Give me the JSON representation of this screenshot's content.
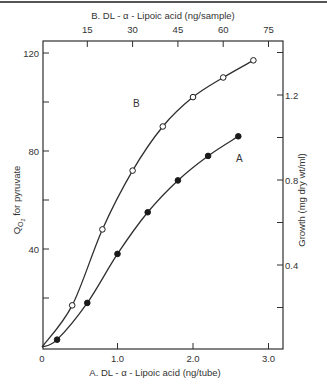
{
  "chart_data": {
    "type": "line",
    "title": "",
    "xlabel": "A. DL-α-Lipoic acid (ng/tube)",
    "x2label": "B. DL-α-Lipoic acid (ng/sample)",
    "ylabel": "Q O2 for pyruvate",
    "y2label": "Growth (mg dry wt/ml)",
    "xlim": [
      0,
      3.2
    ],
    "ylim": [
      0,
      126
    ],
    "x_ticks": [
      "0",
      "1.0",
      "2.0",
      "3.0"
    ],
    "x2_ticks": [
      "15",
      "30",
      "45",
      "60",
      "75"
    ],
    "y_ticks": [
      "40",
      "80",
      "120"
    ],
    "y2_ticks": [
      "0.4",
      "0.8",
      "1.2"
    ],
    "grid": false,
    "legend": "curve labels inline (A, B)",
    "series": [
      {
        "name": "A",
        "marker": "filled-circle",
        "axes": "bottom-left",
        "x": [
          0,
          0.2,
          0.6,
          1.0,
          1.4,
          1.8,
          2.2,
          2.6
        ],
        "values": [
          0,
          3,
          18,
          38,
          55,
          68,
          78,
          86
        ]
      },
      {
        "name": "B",
        "marker": "open-circle",
        "axes": "top-right",
        "x": [
          0,
          0.4,
          0.8,
          1.2,
          1.6,
          2.0,
          2.4,
          2.8
        ],
        "values": [
          0,
          17,
          48,
          72,
          90,
          102,
          110,
          117
        ]
      }
    ]
  },
  "labels": {
    "top_axis": "B. DL - α - Lipoic acid (ng/sample)",
    "bottom_axis": "A. DL - α - Lipoic acid (ng/tube)",
    "left_axis_q": "Q",
    "left_axis_sub": "O",
    "left_axis_subsub": "2",
    "left_axis_rest": " for pyruvate",
    "right_axis": "Growth (mg dry wt/ml)",
    "curve_a": "A",
    "curve_b": "B"
  }
}
